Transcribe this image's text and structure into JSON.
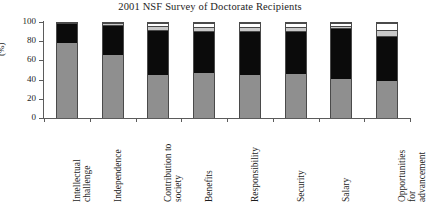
{
  "chart_data": {
    "type": "bar",
    "subtype": "stacked-bar-vertical",
    "title": "2001 NSF Survey of Doctorate Recipients",
    "xlabel": "",
    "ylabel": "(%)",
    "ylim": [
      0,
      100
    ],
    "yticks": [
      0,
      20,
      40,
      60,
      80,
      100
    ],
    "grid": false,
    "legend": "none",
    "stack_order_bottom_to_top": [
      "very satisfied",
      "somewhat satisfied",
      "somewhat dissatisfied",
      "very dissatisfied"
    ],
    "categories": [
      "Intellectual challenge",
      "Independence",
      "Contribution to society",
      "Benefits",
      "Responsibility",
      "Security",
      "Salary",
      "Opportunities for advancement"
    ],
    "series": [
      {
        "name": "very satisfied",
        "color": "#8f8f8f",
        "values": [
          80,
          68,
          47,
          49,
          47,
          48,
          42,
          40
        ]
      },
      {
        "name": "somewhat satisfied",
        "color": "#0b0b0b",
        "values": [
          20,
          31,
          48,
          44,
          46,
          45,
          55,
          48
        ]
      },
      {
        "name": "somewhat dissatisfied",
        "color": "#c9c9c9",
        "values": [
          0,
          1,
          3,
          4,
          4,
          4,
          1,
          6
        ]
      },
      {
        "name": "very dissatisfied",
        "color": "#ffffff",
        "values": [
          0,
          0,
          2,
          3,
          3,
          3,
          2,
          6
        ]
      }
    ]
  },
  "axis": {
    "y_tick_labels": [
      "100",
      "80",
      "60",
      "40",
      "20",
      "0"
    ],
    "y_axis_title": "(%)"
  },
  "category_label_lines": [
    [
      "Intellectual",
      "challenge"
    ],
    [
      "Independence"
    ],
    [
      "Contribution to",
      "society"
    ],
    [
      "Benefits"
    ],
    [
      "Responsibility"
    ],
    [
      "Security"
    ],
    [
      "Salary"
    ],
    [
      "Opportunities",
      "for",
      "advancement"
    ]
  ],
  "colors": {
    "axis": "#5b5b5b",
    "text": "#1d1d1d",
    "background": "#ffffff",
    "bar_outline": "#4a4a4a"
  }
}
